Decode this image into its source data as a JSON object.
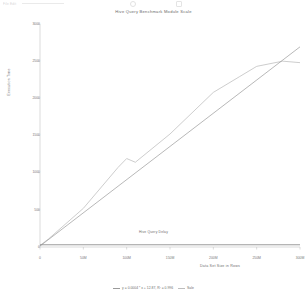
{
  "toolbar": {
    "menu_text": "File  Edit",
    "field_text": "",
    "icons": [
      "circle-icon",
      "shape-icon"
    ]
  },
  "chart_data": {
    "type": "line",
    "title": "Hive Query Benchmark Module Scale",
    "xlabel": "Data Set Size in Rows",
    "ylabel": "Execution Time",
    "xlim": [
      0,
      300000000
    ],
    "ylim": [
      0,
      3000
    ],
    "grid": false,
    "legend_position": "bottom",
    "x_ticks": [
      {
        "value": 0,
        "label": "0"
      },
      {
        "value": 50000000,
        "label": "50M"
      },
      {
        "value": 100000000,
        "label": "100M"
      },
      {
        "value": 150000000,
        "label": "150M"
      },
      {
        "value": 200000000,
        "label": "200M"
      },
      {
        "value": 250000000,
        "label": "250M"
      },
      {
        "value": 300000000,
        "label": "300M"
      }
    ],
    "y_ticks": [
      {
        "value": 0,
        "label": "0"
      },
      {
        "value": 500,
        "label": "500"
      },
      {
        "value": 1000,
        "label": "1000"
      },
      {
        "value": 1500,
        "label": "1500"
      },
      {
        "value": 2000,
        "label": "2000"
      },
      {
        "value": 2500,
        "label": "2500"
      },
      {
        "value": 3000,
        "label": "3000"
      }
    ],
    "series": [
      {
        "name": "Sale",
        "color": "#b8b8b8",
        "x": [
          0,
          10000000,
          50000000,
          90000000,
          100000000,
          110000000,
          150000000,
          200000000,
          230000000,
          250000000,
          280000000,
          300000000
        ],
        "values": [
          20,
          110,
          520,
          1070,
          1190,
          1140,
          1520,
          2080,
          2290,
          2430,
          2500,
          2480
        ]
      },
      {
        "name": "Trendline",
        "color": "#9a9a9a",
        "x": [
          0,
          300000000
        ],
        "values": [
          12.87,
          2692.87
        ]
      },
      {
        "name": "Hive Query Delay",
        "color": "#8f8f8f",
        "x": [
          0,
          300000000
        ],
        "values": [
          30,
          30
        ]
      }
    ],
    "annotations": [
      {
        "text": "Hive Query Delay",
        "x": 150000000,
        "y": 30
      }
    ],
    "legend": [
      {
        "label": "y = 0.0004 * x + 12.87, R² = 0.996",
        "color": "#9a9a9a"
      },
      {
        "label": "Sale",
        "color": "#bdbdbd"
      }
    ]
  }
}
